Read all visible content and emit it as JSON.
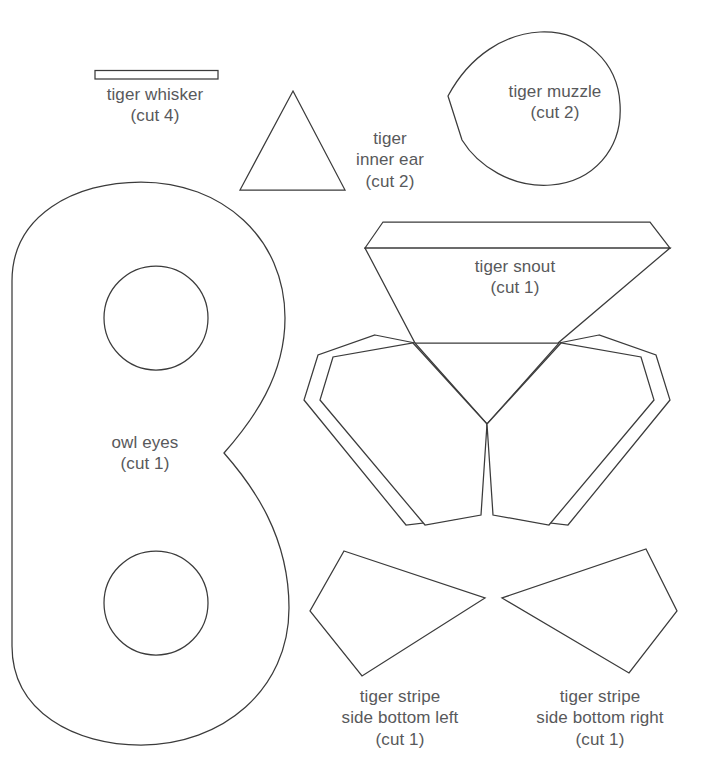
{
  "document": {
    "title": "Tiger and Owl Felt Applique Pattern Template",
    "background_color": "#ffffff",
    "line_color": "#3b3b3b",
    "text_color": "#58595b"
  },
  "pieces": [
    {
      "id": "tiger-whisker",
      "name": "tiger whisker",
      "cut": "(cut 4)",
      "shape": "thin-rectangle"
    },
    {
      "id": "tiger-inner-ear",
      "name_line1": "tiger",
      "name_line2": "inner ear",
      "cut": "(cut 2)",
      "shape": "triangle"
    },
    {
      "id": "tiger-muzzle",
      "name": "tiger muzzle",
      "cut": "(cut 2)",
      "shape": "teardrop"
    },
    {
      "id": "tiger-snout",
      "name": "tiger snout",
      "cut": "(cut 1)",
      "shape": "trapezoid-with-strip"
    },
    {
      "id": "owl-eyes",
      "name": "owl eyes",
      "cut": "(cut 1)",
      "shape": "figure-eight-mask-with-two-holes"
    },
    {
      "id": "tiger-stripe-side-bottom-left",
      "name_line1": "tiger stripe",
      "name_line2": "side bottom left",
      "cut": "(cut 1)",
      "shape": "wedge-quadrilateral"
    },
    {
      "id": "tiger-stripe-side-bottom-right",
      "name_line1": "tiger stripe",
      "name_line2": "side bottom right",
      "cut": "(cut 1)",
      "shape": "wedge-quadrilateral"
    }
  ],
  "labels": {
    "whisker": {
      "name": "tiger whisker",
      "cut": "(cut 4)"
    },
    "inner_ear": {
      "line1": "tiger",
      "line2": "inner ear",
      "cut": "(cut 2)"
    },
    "muzzle": {
      "name": "tiger muzzle",
      "cut": "(cut 2)"
    },
    "snout": {
      "name": "tiger snout",
      "cut": "(cut 1)"
    },
    "owl_eyes": {
      "name": "owl eyes",
      "cut": "(cut 1)"
    },
    "stripe_left": {
      "line1": "tiger stripe",
      "line2": "side bottom left",
      "cut": "(cut 1)"
    },
    "stripe_right": {
      "line1": "tiger stripe",
      "line2": "side bottom right",
      "cut": "(cut 1)"
    }
  }
}
